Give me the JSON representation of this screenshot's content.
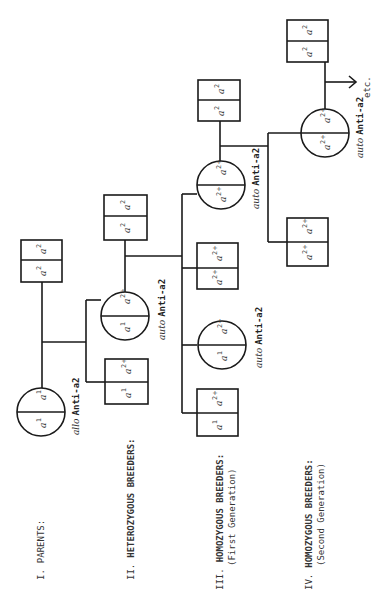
{
  "generations": [
    {
      "id": "I",
      "label": "I.",
      "title": "PARENTS:",
      "subtitle": ""
    },
    {
      "id": "II",
      "label": "II.",
      "title": "HETEROZYGOUS BREEDERS:",
      "subtitle": ""
    },
    {
      "id": "III",
      "label": "III.",
      "title": "HOMOZYGOUS BREEDERS:",
      "subtitle": "(First Generation)"
    },
    {
      "id": "IV",
      "label": "IV.",
      "title": "HOMOZYGOUS BREEDERS:",
      "subtitle": "(Second Generation)"
    }
  ],
  "allele_base": "a",
  "nodes": {
    "p_circle": {
      "top": "1",
      "bottom": "1",
      "label_prefix": "allo",
      "label": "Anti-a2"
    },
    "p_square": {
      "top": "2",
      "bottom": "2"
    },
    "g2_circle": {
      "top": "2+",
      "bottom": "1",
      "label_prefix": "auto",
      "label": "Anti-a2"
    },
    "g2_sq_left": {
      "top": "2+",
      "bottom": "1"
    },
    "g2_sq_top": {
      "top": "2",
      "bottom": "2"
    },
    "g3_circle_left": {
      "top": "2+",
      "bottom": "1",
      "label_prefix": "auto",
      "label": "Anti-a2"
    },
    "g3_sq_left": {
      "top": "2+",
      "bottom": "1"
    },
    "g3_sq_mid": {
      "top": "2+",
      "bottom": "2+"
    },
    "g3_circle_right": {
      "top": "2+",
      "bottom": "2+",
      "label_prefix": "auto",
      "label": "Anti-a2"
    },
    "g3_sq_top": {
      "top": "2",
      "bottom": "2"
    },
    "g4_sq": {
      "top": "2+",
      "bottom": "2+"
    },
    "g4_circle": {
      "top": "2+",
      "bottom": "2+",
      "label_prefix": "auto",
      "label": "Anti-a2"
    },
    "g4_sq_top": {
      "top": "2",
      "bottom": "2"
    }
  },
  "continuation": "etc."
}
